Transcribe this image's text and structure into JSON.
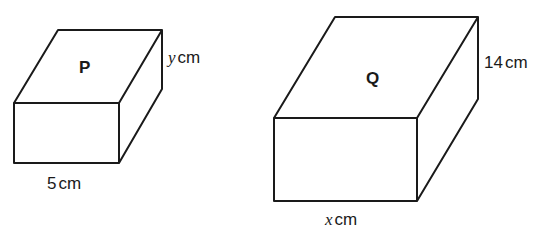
{
  "diagram": {
    "type": "cuboids",
    "shapes": [
      {
        "id": "P",
        "label": "P",
        "dimensions": {
          "width": {
            "var": "",
            "value": "5",
            "unit": "cm"
          },
          "height": {
            "var": "y",
            "unit": "cm"
          }
        }
      },
      {
        "id": "Q",
        "label": "Q",
        "dimensions": {
          "width": {
            "var": "x",
            "unit": "cm"
          },
          "height": {
            "value": "14",
            "unit": "cm"
          }
        }
      }
    ]
  },
  "labels": {
    "p_name": "P",
    "p_width_value": "5",
    "p_width_unit": "cm",
    "p_height_var": "y",
    "p_height_unit": "cm",
    "q_name": "Q",
    "q_width_var": "x",
    "q_width_unit": "cm",
    "q_height_value": "14",
    "q_height_unit": "cm"
  },
  "colors": {
    "stroke": "#1a1a1a",
    "background": "#ffffff"
  }
}
